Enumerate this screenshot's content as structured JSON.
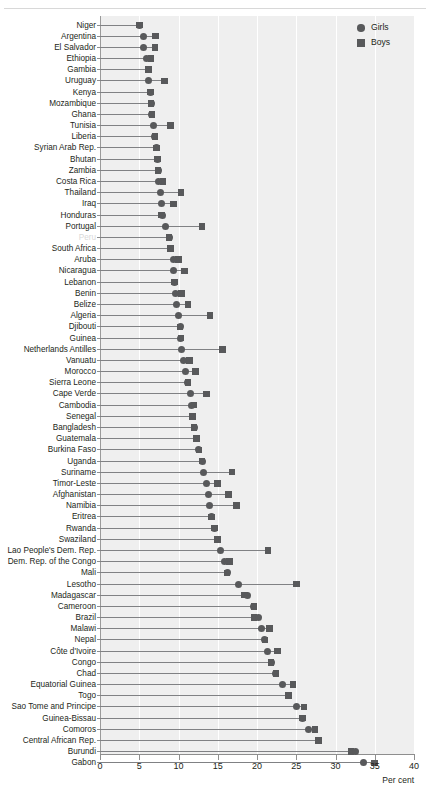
{
  "figure": {
    "axis_title": "Per cent",
    "legend": [
      {
        "key": "girls",
        "label": "Girls",
        "marker": "circle"
      },
      {
        "key": "boys",
        "label": "Boys",
        "marker": "square"
      }
    ],
    "marker_color": "#58595b",
    "panel_color": "#efefef",
    "connector_color": "#808184"
  },
  "chart_data": {
    "type": "scatter",
    "subtype": "dumbbell / paired dot plot",
    "title": "",
    "xlabel": "Per cent",
    "ylabel": "",
    "xlim": [
      0,
      40
    ],
    "xticks": [
      0,
      5,
      10,
      15,
      20,
      25,
      30,
      35,
      40
    ],
    "grid": "vertical gridlines at each tick",
    "legend_position": "top-right",
    "categories": [
      "Niger",
      "Argentina",
      "El Salvador",
      "Ethiopia",
      "Gambia",
      "Uruguay",
      "Kenya",
      "Mozambique",
      "Ghana",
      "Tunisia",
      "Liberia",
      "Syrian Arab Rep.",
      "Bhutan",
      "Zambia",
      "Costa Rica",
      "Thailand",
      "Iraq",
      "Honduras",
      "Portugal",
      "Peru",
      "South Africa",
      "Aruba",
      "Nicaragua",
      "Lebanon",
      "Benin",
      "Belize",
      "Algeria",
      "Djibouti",
      "Guinea",
      "Netherlands Antilles",
      "Vanuatu",
      "Morocco",
      "Sierra Leone",
      "Cape Verde",
      "Cambodia",
      "Senegal",
      "Bangladesh",
      "Guatemala",
      "Burkina Faso",
      "Uganda",
      "Suriname",
      "Timor-Leste",
      "Afghanistan",
      "Namibia",
      "Eritrea",
      "Rwanda",
      "Swaziland",
      "Lao People's Dem. Rep.",
      "Dem. Rep. of the Congo",
      "Mali",
      "Lesotho",
      "Madagascar",
      "Cameroon",
      "Brazil",
      "Malawi",
      "Nepal",
      "Côte d'Ivoire",
      "Congo",
      "Chad",
      "Equatorial Guinea",
      "Togo",
      "Sao Tome and Principe",
      "Guinea-Bissau",
      "Comoros",
      "Central African Rep.",
      "Burundi",
      "Gabon"
    ],
    "series": [
      {
        "name": "Girls",
        "marker": "circle",
        "values": [
          5.0,
          5.6,
          5.6,
          5.9,
          6.2,
          6.2,
          6.4,
          6.5,
          6.6,
          6.8,
          7.0,
          7.2,
          7.3,
          7.4,
          7.5,
          7.7,
          7.8,
          8.0,
          8.4,
          8.8,
          9.0,
          9.3,
          9.4,
          9.5,
          9.6,
          9.8,
          10.0,
          10.2,
          10.3,
          10.4,
          10.7,
          10.9,
          11.2,
          11.5,
          11.6,
          11.8,
          12.0,
          12.3,
          12.6,
          13.0,
          13.2,
          13.6,
          13.8,
          14.0,
          14.2,
          14.6,
          15.0,
          15.3,
          15.8,
          16.2,
          17.6,
          18.8,
          19.6,
          20.2,
          20.6,
          21.0,
          21.4,
          21.8,
          22.4,
          23.2,
          24.0,
          25.0,
          25.8,
          26.6,
          27.8,
          32.5,
          33.6
        ]
      },
      {
        "name": "Boys",
        "marker": "square",
        "values": [
          5.0,
          7.1,
          7.0,
          6.5,
          6.2,
          8.2,
          6.4,
          6.5,
          6.6,
          9.0,
          7.0,
          7.2,
          7.3,
          7.4,
          8.0,
          10.3,
          9.4,
          7.8,
          13.0,
          8.8,
          9.0,
          10.0,
          10.8,
          9.5,
          10.4,
          11.2,
          14.0,
          10.2,
          10.3,
          15.6,
          11.4,
          12.2,
          11.2,
          13.6,
          12.0,
          11.8,
          12.0,
          12.3,
          12.6,
          13.0,
          16.8,
          15.0,
          16.4,
          17.4,
          14.2,
          14.6,
          15.0,
          21.4,
          16.5,
          16.2,
          25.0,
          18.4,
          19.6,
          19.6,
          21.6,
          21.0,
          22.6,
          21.8,
          22.4,
          24.6,
          24.0,
          26.0,
          25.8,
          27.4,
          27.8,
          32.0,
          35.0
        ]
      }
    ]
  },
  "top_crop_ghost": ""
}
